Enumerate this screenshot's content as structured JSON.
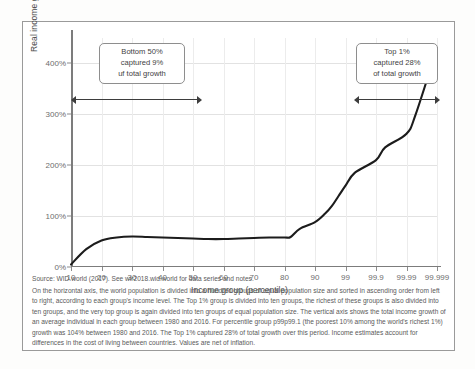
{
  "chart_data": {
    "type": "line",
    "title": "",
    "xlabel": "Income group (percentile)",
    "ylabel": "Real income growth per adult (%)",
    "xticklabels": [
      "10",
      "20",
      "30",
      "40",
      "50",
      "60",
      "70",
      "80",
      "90",
      "99",
      "99.9",
      "99.99",
      "99.999"
    ],
    "yticklabels": [
      "0%",
      "100%",
      "200%",
      "300%",
      "400%"
    ],
    "yvalues": [
      0,
      100,
      200,
      300,
      400
    ],
    "ylim": [
      0,
      450
    ],
    "grid": true,
    "legend": "none",
    "series": [
      {
        "name": "Real income growth per adult 1980-2016",
        "x": [
          "10",
          "15",
          "20",
          "25",
          "30",
          "35",
          "40",
          "45",
          "50",
          "55",
          "60",
          "65",
          "70",
          "75",
          "80",
          "82",
          "85",
          "90",
          "93",
          "95",
          "97",
          "99",
          "99.5",
          "99.9",
          "99.95",
          "99.99",
          "99.995",
          "99.999"
        ],
        "values": [
          5,
          35,
          52,
          58,
          60,
          59,
          58,
          57,
          56,
          55,
          55,
          56,
          57,
          58,
          58,
          59,
          75,
          88,
          105,
          120,
          140,
          160,
          185,
          210,
          235,
          262,
          300,
          430
        ]
      }
    ],
    "annotations": [
      {
        "name": "bottom-50-callout",
        "lines": [
          "Bottom 50%",
          "captured 9%",
          "uf total growth"
        ],
        "span_from": "10",
        "span_to": "50"
      },
      {
        "name": "top-1-callout",
        "lines": [
          "Top 1%",
          "captured 28%",
          "of total growth"
        ],
        "span_from": "99",
        "span_to": "99.999"
      }
    ]
  },
  "caption": {
    "source": "Source: WID.world (2017). See wir2018.wid.world for data series and notes.",
    "body": "On the horizontal axis, the world population is divided into a hundred groups of equal population size and sorted in ascending order from left to right, according to each group's income level. The Top 1% group is divided into ten groups, the richest of these groups is also divided into ten groups, and the very top group is again divided into ten groups of equal population size. The vertical axis shows the total income growth of an average individual in each group between 1980 and 2016. For percentile group p99p99.1 (the poorest 10% among the world's richest 1%) growth was 104% between 1980 and 2016. The Top 1% captured 28% of total growth over this period. Income estimates account for differences in the cost of living between countries. Values are net of inflation."
  },
  "colors": {
    "line": "#1c1c1c",
    "grid": "#e2e2e2",
    "axis": "#7c7c7c",
    "text": "#4a4a4a",
    "callout_border": "#8e8e8e"
  }
}
